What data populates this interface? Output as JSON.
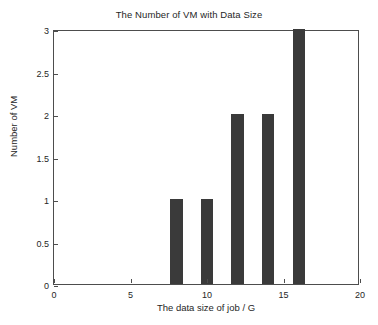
{
  "chart_data": {
    "type": "bar",
    "title": "The Number of VM with Data Size",
    "xlabel": "The data size of job / G",
    "ylabel": "Number of VM",
    "x": [
      8,
      10,
      12,
      14,
      16
    ],
    "values": [
      1,
      1,
      2,
      2,
      3
    ],
    "categories": [
      "8",
      "10",
      "12",
      "14",
      "16"
    ],
    "bar_width": 0.8,
    "xlim": [
      0,
      20
    ],
    "ylim": [
      0,
      3
    ],
    "xticks": [
      0,
      5,
      10,
      15,
      20
    ],
    "xtick_labels": [
      "0",
      "5",
      "10",
      "15",
      "20"
    ],
    "yticks": [
      0,
      0.5,
      1,
      1.5,
      2,
      2.5,
      3
    ],
    "ytick_labels": [
      "0",
      "0.5",
      "1",
      "1.5",
      "2",
      "2.5",
      "3"
    ],
    "grid": false,
    "legend": null,
    "bar_color": "#3a3a3a",
    "axis_color": "#4d4d4d",
    "background_color": "#ffffff"
  }
}
